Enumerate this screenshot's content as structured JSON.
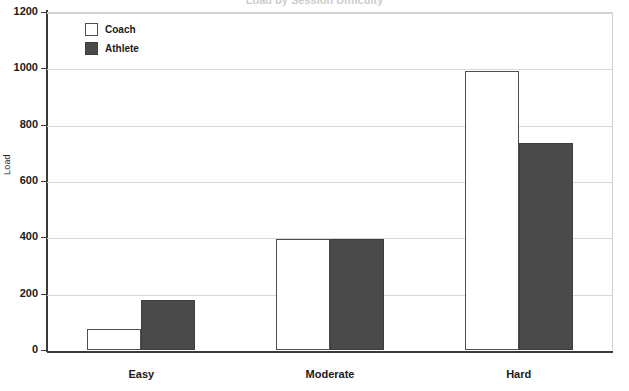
{
  "chart_data": {
    "type": "bar",
    "title": "Load by Session Difficulty",
    "xlabel": "",
    "ylabel": "Load",
    "categories": [
      "Easy",
      "Moderate",
      "Hard"
    ],
    "series": [
      {
        "name": "Coach",
        "color": "#ffffff",
        "values": [
          74,
          393,
          990
        ]
      },
      {
        "name": "Athlete",
        "color": "#4a4a4a",
        "values": [
          177,
          393,
          734
        ]
      }
    ],
    "ylim": [
      0,
      1200
    ],
    "yticks": [
      0,
      200,
      400,
      600,
      800,
      1000,
      1200
    ],
    "ytick_labels": [
      "0",
      "200",
      "400",
      "600",
      "800",
      "1000",
      "1200"
    ],
    "grid": true,
    "legend_position": "top-left"
  },
  "axes": {
    "y_title": "Load"
  },
  "legend": {
    "entries": [
      {
        "label": "Coach",
        "swatch": "hollow-square-swatch"
      },
      {
        "label": "Athlete",
        "swatch": "filled-square-swatch"
      }
    ]
  },
  "colors": {
    "athlete_fill": "#4a4a4a",
    "coach_fill": "#ffffff",
    "axis": "#3a3a3a",
    "grid": "#d6d6d6"
  }
}
